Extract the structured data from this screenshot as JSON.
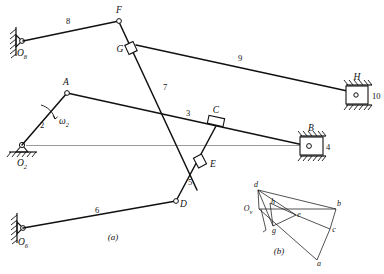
{
  "figure": {
    "sub_caption_a": "(a)",
    "sub_caption_b": "(b)",
    "stroke_color": "#111111",
    "axis_color": "#9a9a9a"
  },
  "mechanism": {
    "caption": "(a)",
    "joints": [
      {
        "id": "O8",
        "letter": "O",
        "subscript": "8",
        "x": 22,
        "y": 41,
        "type": "fixed-pivot"
      },
      {
        "id": "O2",
        "letter": "O",
        "subscript": "2",
        "x": 22,
        "y": 145,
        "type": "fixed-pivot"
      },
      {
        "id": "O6",
        "letter": "O",
        "subscript": "6",
        "x": 23,
        "y": 228,
        "type": "fixed-pivot"
      },
      {
        "id": "F",
        "letter": "F",
        "subscript": "",
        "x": 119,
        "y": 21,
        "type": "pin"
      },
      {
        "id": "G",
        "letter": "G",
        "subscript": "",
        "x": 131,
        "y": 49,
        "type": "slider"
      },
      {
        "id": "A",
        "letter": "A",
        "subscript": "",
        "x": 67,
        "y": 93,
        "type": "pin"
      },
      {
        "id": "C",
        "letter": "C",
        "subscript": "",
        "x": 216,
        "y": 124,
        "type": "slider"
      },
      {
        "id": "E",
        "letter": "E",
        "subscript": "",
        "x": 200,
        "y": 162,
        "type": "slider"
      },
      {
        "id": "D",
        "letter": "D",
        "subscript": "",
        "x": 176,
        "y": 201,
        "type": "pin"
      },
      {
        "id": "B",
        "letter": "B",
        "subscript": "",
        "x": 308,
        "y": 146,
        "type": "slider-block"
      },
      {
        "id": "H",
        "letter": "H",
        "subscript": "",
        "x": 356,
        "y": 95,
        "type": "slider-block"
      }
    ],
    "link_numbers": [
      {
        "label": "8",
        "x": 68,
        "y": 24
      },
      {
        "label": "9",
        "x": 240,
        "y": 61
      },
      {
        "label": "10",
        "x": 368,
        "y": 96
      },
      {
        "label": "7",
        "x": 165,
        "y": 88
      },
      {
        "label": "2",
        "x": 42,
        "y": 127
      },
      {
        "label": "3",
        "x": 187,
        "y": 114
      },
      {
        "label": "4",
        "x": 328,
        "y": 146
      },
      {
        "label": "5",
        "x": 188,
        "y": 183
      },
      {
        "label": "6",
        "x": 97,
        "y": 212
      }
    ],
    "angular_velocity": {
      "symbol": "ω",
      "subscript": "2",
      "x": 59,
      "y": 122
    }
  },
  "velocity_polygon": {
    "caption": "(b)",
    "pole_label": "O",
    "pole_subscript": "v",
    "nodes": [
      {
        "id": "d",
        "label": "d",
        "x": 256,
        "y": 189
      },
      {
        "id": "Ov",
        "label": "O",
        "x": 250,
        "y": 209
      },
      {
        "id": "h",
        "label": "h",
        "x": 273,
        "y": 206
      },
      {
        "id": "e",
        "label": "e",
        "x": 297,
        "y": 214
      },
      {
        "id": "b",
        "label": "b",
        "x": 336,
        "y": 207
      },
      {
        "id": "c",
        "label": "c",
        "x": 330,
        "y": 228
      },
      {
        "id": "g",
        "label": "g",
        "x": 274,
        "y": 228
      },
      {
        "id": "a",
        "label": "a",
        "x": 316,
        "y": 262
      }
    ]
  }
}
